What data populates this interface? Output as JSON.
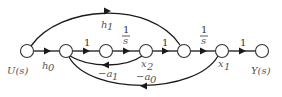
{
  "diagram": {
    "type": "signal-flow-graph",
    "nodes": [
      {
        "id": "U",
        "label": "U(s)",
        "x": 27,
        "y": 51
      },
      {
        "id": "n2",
        "label": "",
        "x": 66,
        "y": 51
      },
      {
        "id": "n3",
        "label": "",
        "x": 106,
        "y": 51
      },
      {
        "id": "x2",
        "label": "x2",
        "x": 146,
        "y": 51
      },
      {
        "id": "n5",
        "label": "",
        "x": 184,
        "y": 51
      },
      {
        "id": "x1",
        "label": "x1",
        "x": 222,
        "y": 51
      },
      {
        "id": "Y",
        "label": "Y(s)",
        "x": 262,
        "y": 51
      }
    ],
    "edges": [
      {
        "from": "U",
        "to": "n2",
        "gain": "h0"
      },
      {
        "from": "n2",
        "to": "n3",
        "gain": "1"
      },
      {
        "from": "n3",
        "to": "x2",
        "gain": "1/s"
      },
      {
        "from": "x2",
        "to": "n5",
        "gain": "1"
      },
      {
        "from": "n5",
        "to": "x1",
        "gain": "1/s"
      },
      {
        "from": "x1",
        "to": "Y",
        "gain": "1"
      },
      {
        "from": "U",
        "to": "n5",
        "gain": "h1"
      },
      {
        "from": "x2",
        "to": "n2",
        "gain": "-a1"
      },
      {
        "from": "x1",
        "to": "n2",
        "gain": "-a0"
      }
    ],
    "labels": {
      "u": "U(s)",
      "y": "Y(s)",
      "x1": "x",
      "x1_sub": "1",
      "x2": "x",
      "x2_sub": "2",
      "h0": "h",
      "h0_sub": "0",
      "h1": "h",
      "h1_sub": "1",
      "g1": "1",
      "g3": "1",
      "g6": "1",
      "one": "1",
      "s": "s",
      "a1": "−a",
      "a1_sub": "1",
      "a0": "−a",
      "a0_sub": "0"
    }
  }
}
